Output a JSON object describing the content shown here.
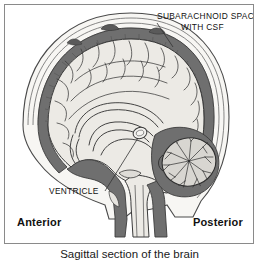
{
  "figure": {
    "caption": "Sagittal section of the brain",
    "orientation": {
      "anterior": "Anterior",
      "posterior": "Posterior"
    },
    "annotations": [
      {
        "id": "subarachnoid",
        "line1": "SUBARACHNOID SPACE",
        "line2": "WITH CSF",
        "target": "dark band between skull and brain surface"
      },
      {
        "id": "ventricle",
        "line1": "VENTRICLE",
        "target": "small oval cavity in central brain"
      }
    ],
    "structures": [
      "skull",
      "subarachnoid space with CSF",
      "cerebral cortex with sulci and gyri",
      "corpus callosum",
      "fornix",
      "lateral ventricle",
      "cerebellum with arbor vitae",
      "brainstem",
      "spinal cord"
    ],
    "colors": {
      "background": "#ffffff",
      "border": "#8a8a8a",
      "ink": "#111111",
      "brain_tissue": "#eceae5",
      "dura_dark": "#6f6f6f",
      "dura_darker": "#5a5a5a",
      "skull_fill": "#f7f6f3",
      "cerebellum_fill": "#d8d6d1",
      "line": "#3a3a3a"
    }
  }
}
